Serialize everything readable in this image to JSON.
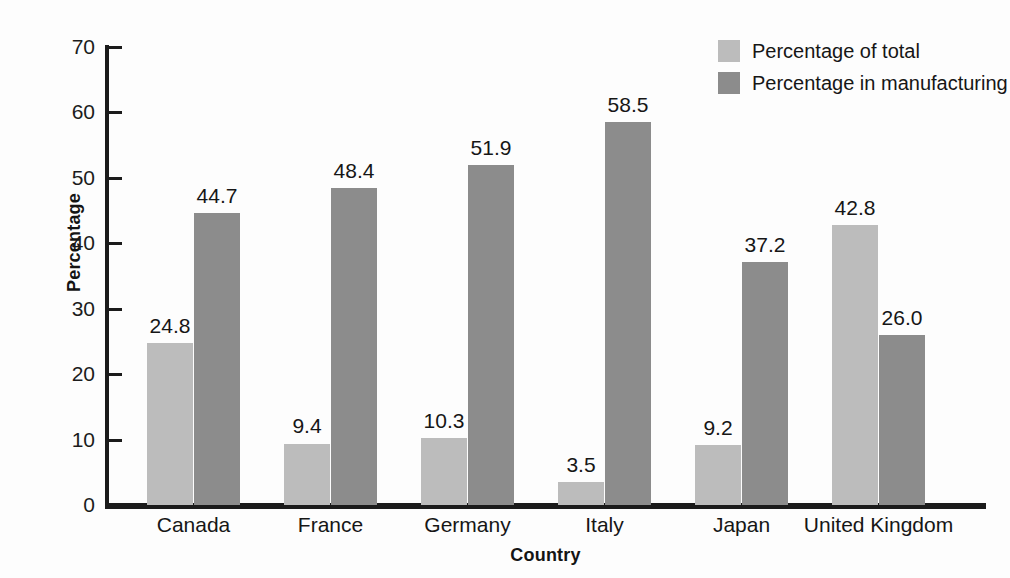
{
  "chart_data": {
    "type": "bar",
    "title": "",
    "xlabel": "Country",
    "ylabel": "Percentage",
    "categories": [
      "Canada",
      "France",
      "Germany",
      "Italy",
      "Japan",
      "United Kingdom"
    ],
    "series": [
      {
        "name": "Percentage of total",
        "color": "#bcbcbc",
        "values": [
          24.8,
          9.4,
          10.3,
          3.5,
          9.2,
          42.8
        ],
        "labels": [
          "24.8",
          "9.4",
          "10.3",
          "3.5",
          "9.2",
          "42.8"
        ]
      },
      {
        "name": "Percentage in manufacturing",
        "color": "#8c8c8c",
        "values": [
          44.7,
          48.4,
          51.9,
          58.5,
          37.2,
          26.0
        ],
        "labels": [
          "44.7",
          "48.4",
          "51.9",
          "58.5",
          "37.2",
          "26.0"
        ]
      }
    ],
    "ylim": [
      0,
      70
    ],
    "yticks": [
      0,
      10,
      20,
      30,
      40,
      50,
      60,
      70
    ],
    "ytick_labels": [
      "0",
      "10",
      "20",
      "30",
      "40",
      "50",
      "60",
      "70"
    ],
    "grid": false,
    "legend_position": "top-right"
  },
  "axes": {
    "y_title": "Percentage",
    "x_title": "Country"
  },
  "legend": {
    "items": [
      {
        "label": "Percentage of total",
        "color": "#bcbcbc"
      },
      {
        "label": "Percentage in manufacturing",
        "color": "#8c8c8c"
      }
    ]
  }
}
